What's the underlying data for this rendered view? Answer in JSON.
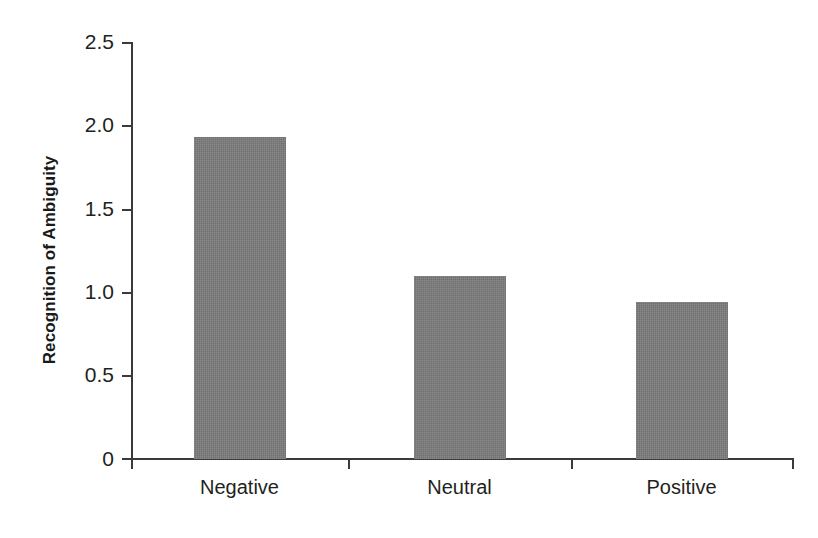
{
  "chart_data": {
    "type": "bar",
    "title": "",
    "xlabel": "",
    "ylabel": "Recognition of Ambiguity",
    "categories": [
      "Negative",
      "Neutral",
      "Positive"
    ],
    "values": [
      1.93,
      1.1,
      0.94
    ],
    "ylim": [
      0,
      2.5
    ],
    "ytick_labels": [
      "0",
      "0.5",
      "1.0",
      "1.5",
      "2.0",
      "2.5"
    ],
    "ytick_values": [
      0,
      0.5,
      1.0,
      1.5,
      2.0,
      2.5
    ],
    "grid": false,
    "legend": null,
    "legend_position": "none",
    "series": [
      {
        "name": "Recognition of Ambiguity",
        "values": [
          1.93,
          1.1,
          0.94
        ],
        "color": "#7c7c7c"
      }
    ],
    "colors": {
      "bar_fill": "#7c7c7c",
      "axis": "#3a3a3a",
      "text": "#231f20",
      "background": "#ffffff"
    }
  }
}
